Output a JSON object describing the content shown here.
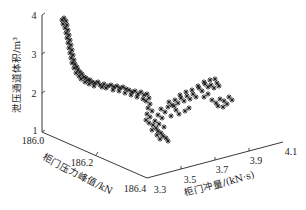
{
  "chart_data": {
    "type": "scatter",
    "dimensions": 3,
    "title": "",
    "marker": "star",
    "marker_color": "#222222",
    "axes": {
      "z": {
        "label": "泄压通道体积/m³",
        "ticks": [
          "1",
          "2",
          "3",
          "4"
        ],
        "range": [
          1,
          4
        ]
      },
      "y": {
        "label": "柜门压力峰值/kN",
        "ticks": [
          "186.0",
          "186.2",
          "186.4"
        ],
        "range": [
          186.0,
          186.4
        ]
      },
      "x": {
        "label": "柜门冲量/(kN·s)",
        "ticks": [
          "3.3",
          "3.5",
          "3.7",
          "3.9",
          "4.1"
        ],
        "range": [
          3.3,
          4.1
        ]
      }
    },
    "grid": false,
    "legend": null,
    "screen_points": [
      [
        62,
        20
      ],
      [
        64,
        18
      ],
      [
        66,
        21
      ],
      [
        63,
        24
      ],
      [
        67,
        25
      ],
      [
        65,
        28
      ],
      [
        68,
        30
      ],
      [
        66,
        33
      ],
      [
        69,
        35
      ],
      [
        67,
        38
      ],
      [
        70,
        40
      ],
      [
        68,
        43
      ],
      [
        71,
        45
      ],
      [
        69,
        48
      ],
      [
        72,
        50
      ],
      [
        70,
        53
      ],
      [
        73,
        55
      ],
      [
        71,
        58
      ],
      [
        74,
        60
      ],
      [
        72,
        63
      ],
      [
        75,
        64
      ],
      [
        77,
        67
      ],
      [
        74,
        68
      ],
      [
        78,
        70
      ],
      [
        80,
        72
      ],
      [
        76,
        73
      ],
      [
        82,
        74
      ],
      [
        79,
        76
      ],
      [
        84,
        77
      ],
      [
        81,
        79
      ],
      [
        86,
        78
      ],
      [
        88,
        80
      ],
      [
        85,
        82
      ],
      [
        90,
        80
      ],
      [
        92,
        82
      ],
      [
        89,
        84
      ],
      [
        95,
        83
      ],
      [
        98,
        82
      ],
      [
        94,
        86
      ],
      [
        100,
        85
      ],
      [
        104,
        84
      ],
      [
        102,
        87
      ],
      [
        108,
        86
      ],
      [
        111,
        85
      ],
      [
        106,
        88
      ],
      [
        114,
        87
      ],
      [
        117,
        86
      ],
      [
        113,
        90
      ],
      [
        120,
        88
      ],
      [
        123,
        87
      ],
      [
        119,
        91
      ],
      [
        126,
        89
      ],
      [
        129,
        90
      ],
      [
        125,
        93
      ],
      [
        132,
        92
      ],
      [
        135,
        91
      ],
      [
        131,
        95
      ],
      [
        138,
        94
      ],
      [
        141,
        92
      ],
      [
        137,
        97
      ],
      [
        144,
        95
      ],
      [
        147,
        94
      ],
      [
        143,
        99
      ],
      [
        149,
        98
      ],
      [
        146,
        101
      ],
      [
        150,
        104
      ],
      [
        148,
        108
      ],
      [
        152,
        111
      ],
      [
        147,
        114
      ],
      [
        150,
        117
      ],
      [
        146,
        120
      ],
      [
        149,
        123
      ],
      [
        153,
        125
      ],
      [
        156,
        128
      ],
      [
        152,
        130
      ],
      [
        158,
        131
      ],
      [
        161,
        133
      ],
      [
        157,
        135
      ],
      [
        163,
        136
      ],
      [
        166,
        138
      ],
      [
        160,
        139
      ],
      [
        168,
        141
      ],
      [
        164,
        127
      ],
      [
        159,
        124
      ],
      [
        155,
        121
      ],
      [
        162,
        118
      ],
      [
        158,
        115
      ],
      [
        165,
        112
      ],
      [
        161,
        109
      ],
      [
        168,
        107
      ],
      [
        172,
        105
      ],
      [
        169,
        102
      ],
      [
        175,
        100
      ],
      [
        178,
        103
      ],
      [
        174,
        106
      ],
      [
        181,
        98
      ],
      [
        184,
        101
      ],
      [
        180,
        95
      ],
      [
        187,
        96
      ],
      [
        190,
        99
      ],
      [
        186,
        92
      ],
      [
        193,
        94
      ],
      [
        196,
        97
      ],
      [
        192,
        90
      ],
      [
        199,
        88
      ],
      [
        202,
        91
      ],
      [
        198,
        86
      ],
      [
        205,
        84
      ],
      [
        208,
        87
      ],
      [
        204,
        82
      ],
      [
        211,
        85
      ],
      [
        214,
        88
      ],
      [
        210,
        80
      ],
      [
        217,
        83
      ],
      [
        219,
        86
      ],
      [
        215,
        79
      ],
      [
        208,
        94
      ],
      [
        204,
        97
      ],
      [
        212,
        100
      ],
      [
        216,
        103
      ],
      [
        220,
        99
      ],
      [
        224,
        101
      ],
      [
        227,
        104
      ],
      [
        223,
        107
      ],
      [
        218,
        106
      ],
      [
        229,
        97
      ],
      [
        232,
        100
      ],
      [
        189,
        108
      ],
      [
        185,
        111
      ],
      [
        179,
        114
      ],
      [
        176,
        110
      ],
      [
        171,
        116
      ]
    ]
  }
}
